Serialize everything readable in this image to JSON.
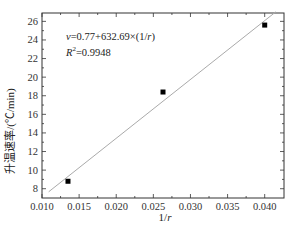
{
  "chart_data": {
    "type": "scatter",
    "title": "",
    "xlabel": "1/r",
    "ylabel": "升温速率/(℃/min)",
    "xlim": [
      0.01,
      0.0426
    ],
    "ylim": [
      7.0,
      26.9
    ],
    "x_ticks": [
      "0.010",
      "0.015",
      "0.020",
      "0.025",
      "0.030",
      "0.035",
      "0.040"
    ],
    "y_ticks": [
      "8",
      "10",
      "12",
      "14",
      "16",
      "18",
      "20",
      "22",
      "24",
      "26"
    ],
    "grid": false,
    "series": [
      {
        "name": "measured",
        "marker": "square",
        "color": "#000000",
        "x": [
          0.0135,
          0.0263,
          0.04
        ],
        "y": [
          8.8,
          18.4,
          25.6
        ]
      },
      {
        "name": "fit",
        "type": "line",
        "color": "#aaaaaa",
        "intercept": 0.77,
        "slope": 632.69,
        "x_range": [
          0.0109,
          0.0415
        ]
      }
    ],
    "annotations": [
      "v=0.77+632.69×(1/r)",
      "R²=0.9948"
    ]
  },
  "labels": {
    "xlabel_pre": "1/",
    "xlabel_var": "r",
    "ylabel": "升温速率/(℃/min)",
    "eq_var": "v",
    "eq_body": "=0.77+632.69×(1/",
    "eq_r": "r",
    "eq_close": ")",
    "r2_var": "R",
    "r2_sup": "2",
    "r2_val": "=0.9948"
  }
}
